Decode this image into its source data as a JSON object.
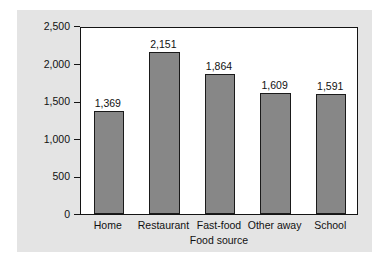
{
  "chart_data": {
    "type": "bar",
    "title": "",
    "subtitle": "",
    "xlabel": "Food source",
    "ylabel": "Milligrams of sodium per 1,000 calories",
    "categories": [
      "Home",
      "Restaurant",
      "Fast-food",
      "Other away",
      "School"
    ],
    "values": [
      1369,
      2151,
      1864,
      1609,
      1591
    ],
    "value_labels": [
      "1,369",
      "2,151",
      "1,864",
      "1,609",
      "1,591"
    ],
    "ylim": [
      0,
      2500
    ],
    "yticks": [
      0,
      500,
      1000,
      1500,
      2000,
      2500
    ],
    "ytick_labels": [
      "0",
      "500",
      "1,000",
      "1,500",
      "2,000",
      "2,500"
    ],
    "grid": false,
    "legend": null,
    "series": [
      {
        "name": "Sodium density",
        "values": [
          1369,
          2151,
          1864,
          1609,
          1591
        ]
      }
    ],
    "colors": {
      "bar_fill": "#878787",
      "bar_edge": "#1a1a1a",
      "panel_background": "#e4e4e4",
      "plot_background": "#ffffff",
      "axis": "#141414",
      "text": "#111111"
    }
  }
}
